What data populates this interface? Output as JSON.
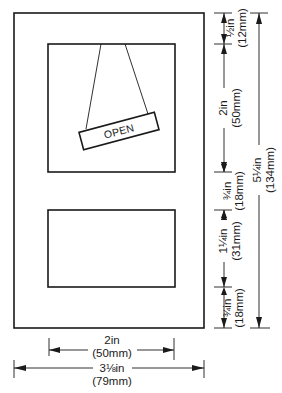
{
  "diagram": {
    "sign": {
      "text": "OPEN"
    },
    "dimensions": {
      "top_margin": {
        "imperial": "½in",
        "metric": "(12mm)"
      },
      "window1_height": {
        "imperial": "2in",
        "metric": "(50mm)"
      },
      "gap_between_windows": {
        "imperial": "¾in",
        "metric": "(18mm)"
      },
      "window2_height": {
        "imperial": "1¼in",
        "metric": "(31mm)"
      },
      "bottom_margin": {
        "imperial": "¾in",
        "metric": "(18mm)"
      },
      "overall_height": {
        "imperial": "5¼in",
        "metric": "(134mm)"
      },
      "window_width": {
        "imperial": "2in",
        "metric": "(50mm)"
      },
      "overall_width": {
        "imperial": "3⅛in",
        "metric": "(79mm)"
      }
    },
    "colors": {
      "line": "#1a1a1a",
      "background": "#ffffff"
    }
  }
}
